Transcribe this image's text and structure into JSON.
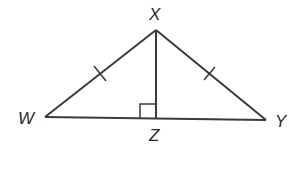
{
  "diagram": {
    "type": "geometry",
    "stroke_color": "#3a3a3a",
    "vertices": {
      "X": {
        "label": "X",
        "x": 156,
        "y": 30
      },
      "W": {
        "label": "W",
        "x": 45,
        "y": 117
      },
      "Y": {
        "label": "Y",
        "x": 266,
        "y": 120
      },
      "Z": {
        "label": "Z",
        "x": 156,
        "y": 118
      }
    },
    "segments": [
      {
        "from": "W",
        "to": "X",
        "tick_marks": 1
      },
      {
        "from": "X",
        "to": "Y",
        "tick_marks": 1
      },
      {
        "from": "W",
        "to": "Y",
        "tick_marks": 0
      },
      {
        "from": "X",
        "to": "Z",
        "tick_marks": 0
      }
    ],
    "right_angle_at": "Z"
  },
  "labels": {
    "X": "X",
    "W": "W",
    "Y": "Y",
    "Z": "Z"
  }
}
